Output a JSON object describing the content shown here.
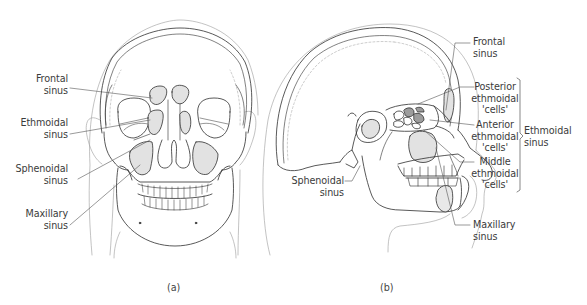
{
  "figure": {
    "panels": [
      {
        "id": "a",
        "caption": "(a)",
        "view": "anterior",
        "labels": [
          {
            "line1": "Frontal",
            "line2": "sinus"
          },
          {
            "line1": "Ethmoidal",
            "line2": "sinus"
          },
          {
            "line1": "Sphenoidal",
            "line2": "sinus"
          },
          {
            "line1": "Maxillary",
            "line2": "sinus"
          }
        ]
      },
      {
        "id": "b",
        "caption": "(b)",
        "view": "lateral",
        "labels": [
          {
            "line1": "Frontal",
            "line2": "sinus"
          },
          {
            "line1": "Posterior",
            "line2": "ethmoidal",
            "line3": "'cells'"
          },
          {
            "line1": "Anterior",
            "line2": "ethmoidal",
            "line3": "'cells'"
          },
          {
            "line1": "Middle",
            "line2": "ethmoidal",
            "line3": "'cells'"
          },
          {
            "line1": "Sphenoidal",
            "line2": "sinus"
          },
          {
            "line1": "Maxillary",
            "line2": "sinus"
          }
        ],
        "bracket_label": {
          "line1": "Ethmoidal",
          "line2": "sinus"
        }
      }
    ],
    "colors": {
      "line": "#2e2e2e",
      "faint_line": "#9a9a9a",
      "sinus_fill": "#e2e2e2",
      "dark_cell_fill": "#9c9c9c"
    }
  }
}
